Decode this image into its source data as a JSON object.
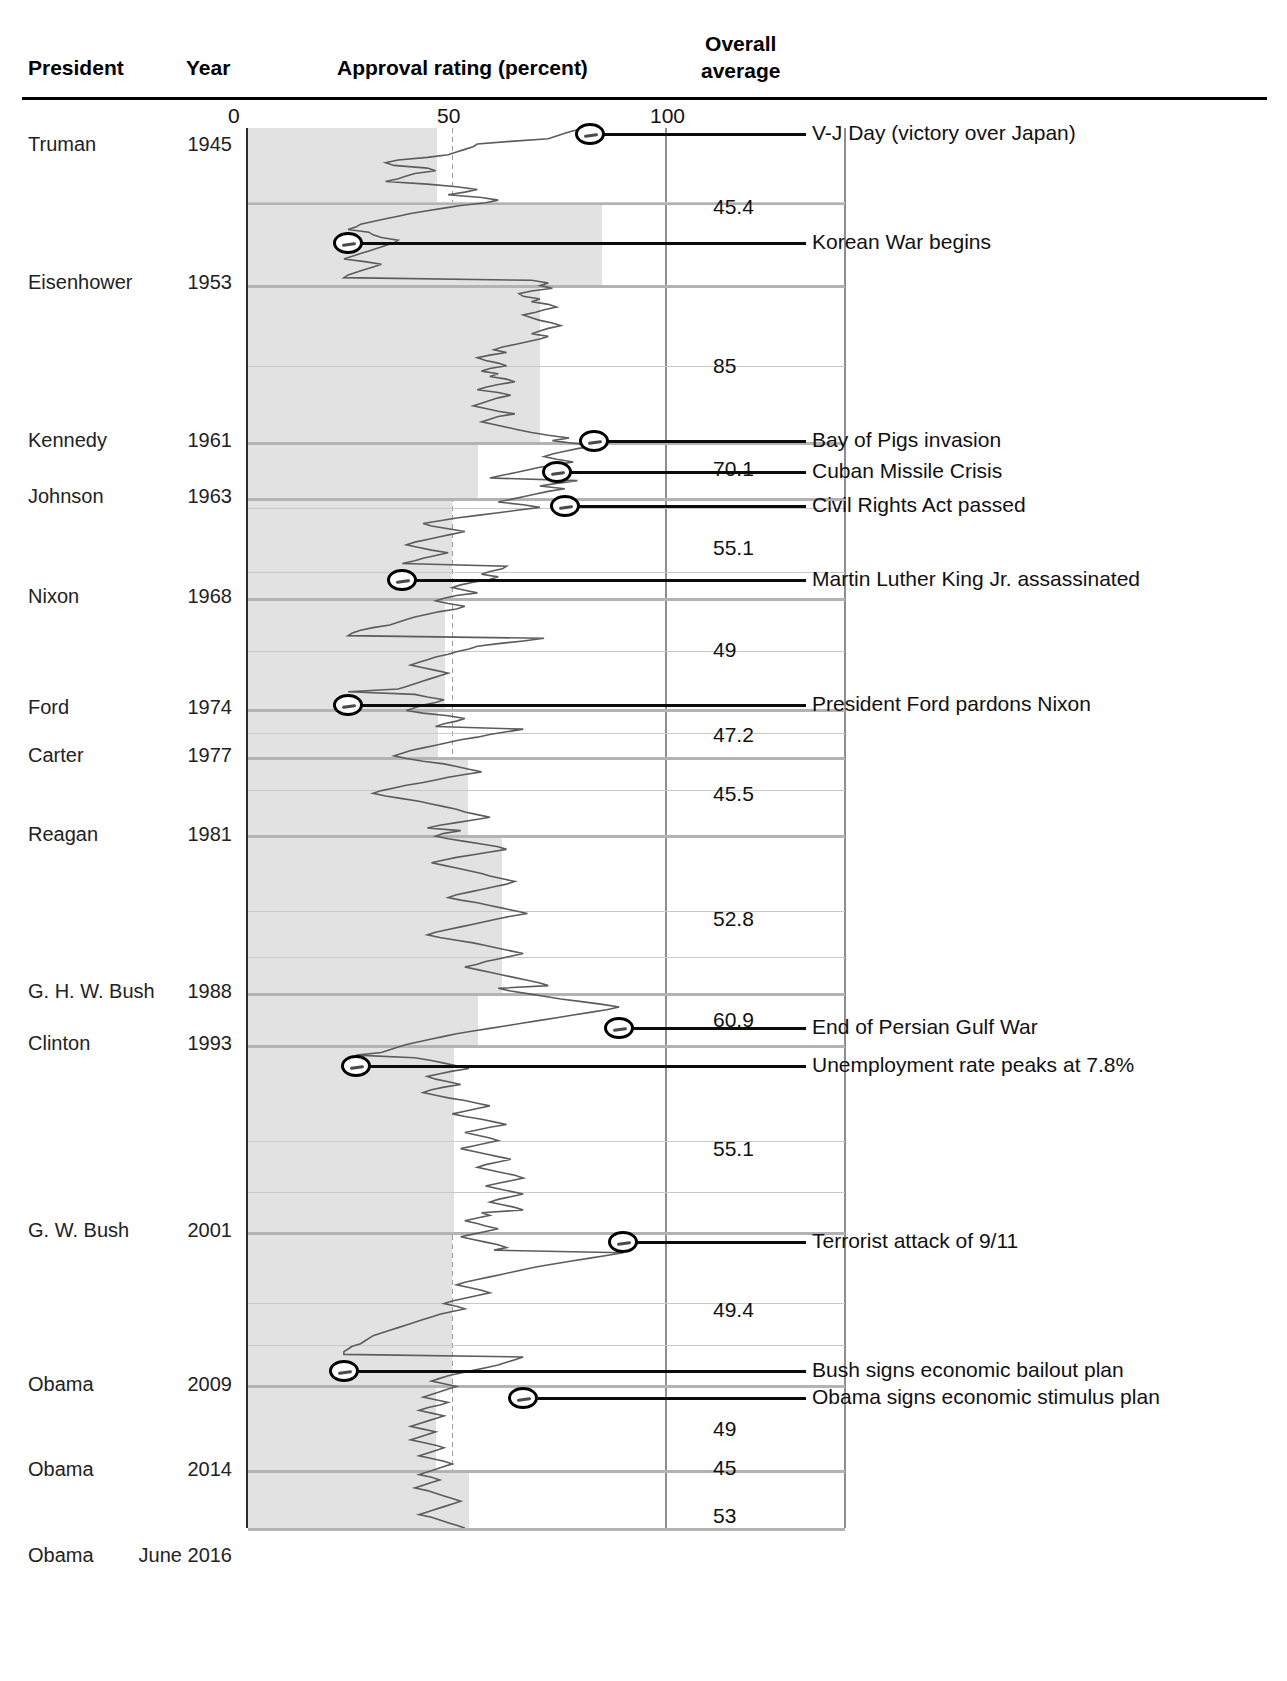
{
  "header": {
    "col_president": "President",
    "col_year": "Year",
    "col_approval": "Approval rating (percent)",
    "col_overall_line1": "Overall",
    "col_overall_line2": "average"
  },
  "axis": {
    "ticks": [
      "0",
      "50",
      "100"
    ],
    "min": 0,
    "max": 100
  },
  "rows": [
    {
      "president": "Truman",
      "year": "1945",
      "average": "45.4"
    },
    {
      "president": "Eisenhower",
      "year": "1953",
      "average": "85"
    },
    {
      "president": "Kennedy",
      "year": "1961",
      "average": "70.1"
    },
    {
      "president": "Johnson",
      "year": "1963",
      "average": "55.1"
    },
    {
      "president": "Nixon",
      "year": "1968",
      "average": "49"
    },
    {
      "president": "Ford",
      "year": "1974",
      "average": "47.2"
    },
    {
      "president": "Carter",
      "year": "1977",
      "average": "45.5"
    },
    {
      "president": "Reagan",
      "year": "1981",
      "average": "52.8"
    },
    {
      "president": "G. H. W. Bush",
      "year": "1988",
      "average": "60.9"
    },
    {
      "president": "Clinton",
      "year": "1993",
      "average": "55.1"
    },
    {
      "president": "G. W. Bush",
      "year": "2001",
      "average": "49.4"
    },
    {
      "president": "Obama",
      "year": "2009",
      "average": "49"
    },
    {
      "president": "Obama",
      "year": "2014",
      "average": "45"
    },
    {
      "president": "Obama",
      "year": "June 2016",
      "average": "53"
    }
  ],
  "annotations": [
    {
      "label": "V-J Day (victory over Japan)",
      "value": 82
    },
    {
      "label": "Korean War begins",
      "value": 24
    },
    {
      "label": "Bay of Pigs invasion",
      "value": 83
    },
    {
      "label": "Cuban Missile Crisis",
      "value": 74
    },
    {
      "label": "Civil Rights Act passed",
      "value": 76
    },
    {
      "label": "Martin Luther King Jr. assassinated",
      "value": 37
    },
    {
      "label": "President Ford pardons Nixon",
      "value": 24
    },
    {
      "label": "End of Persian Gulf War",
      "value": 89
    },
    {
      "label": "Unemployment rate peaks at 7.8%",
      "value": 26
    },
    {
      "label": "Terrorist attack of 9/11",
      "value": 90
    },
    {
      "label": "Bush signs economic bailout plan",
      "value": 23
    },
    {
      "label": "Obama signs economic stimulus plan",
      "value": 66
    }
  ],
  "chart_data": {
    "type": "line",
    "xlabel": "Approval rating (percent)",
    "ylabel": "Year",
    "xlim": [
      0,
      100
    ],
    "grid": true,
    "orientation": "vertical-time",
    "legend": "none",
    "presidents": [
      {
        "name": "Truman",
        "start_year": 1945,
        "overall_average": 45.4
      },
      {
        "name": "Eisenhower",
        "start_year": 1953,
        "overall_average": 85
      },
      {
        "name": "Kennedy",
        "start_year": 1961,
        "overall_average": 70.1
      },
      {
        "name": "Johnson",
        "start_year": 1963,
        "overall_average": 55.1
      },
      {
        "name": "Nixon",
        "start_year": 1968,
        "overall_average": 49
      },
      {
        "name": "Ford",
        "start_year": 1974,
        "overall_average": 47.2
      },
      {
        "name": "Carter",
        "start_year": 1977,
        "overall_average": 45.5
      },
      {
        "name": "Reagan",
        "start_year": 1981,
        "overall_average": 52.8
      },
      {
        "name": "G. H. W. Bush",
        "start_year": 1988,
        "overall_average": 60.9
      },
      {
        "name": "Clinton",
        "start_year": 1993,
        "overall_average": 55.1
      },
      {
        "name": "G. W. Bush",
        "start_year": 2001,
        "overall_average": 49.4
      },
      {
        "name": "Obama",
        "start_year": 2009,
        "overall_average": 49
      },
      {
        "name": "Obama",
        "start_year": 2014,
        "overall_average": 45
      },
      {
        "name": "Obama",
        "start_year": 2016,
        "overall_average": 53
      }
    ],
    "events": [
      {
        "label": "V-J Day (victory over Japan)",
        "approval": 82
      },
      {
        "label": "Korean War begins",
        "approval": 24
      },
      {
        "label": "Bay of Pigs invasion",
        "approval": 83
      },
      {
        "label": "Cuban Missile Crisis",
        "approval": 74
      },
      {
        "label": "Civil Rights Act passed",
        "approval": 76
      },
      {
        "label": "Martin Luther King Jr. assassinated",
        "approval": 37
      },
      {
        "label": "President Ford pardons Nixon",
        "approval": 24
      },
      {
        "label": "End of Persian Gulf War",
        "approval": 89
      },
      {
        "label": "Unemployment rate peaks at 7.8%",
        "approval": 26
      },
      {
        "label": "Terrorist attack of 9/11",
        "approval": 90
      },
      {
        "label": "Bush signs economic bailout plan",
        "approval": 23
      },
      {
        "label": "Obama signs economic stimulus plan",
        "approval": 66
      }
    ],
    "series_values": [
      82,
      78,
      76,
      74,
      72,
      63,
      55,
      54,
      52,
      50,
      48,
      43,
      36,
      33,
      35,
      43,
      45,
      40,
      38,
      36,
      33,
      43,
      50,
      55,
      52,
      48,
      56,
      60,
      57,
      51,
      47,
      43,
      39,
      36,
      33,
      30,
      27,
      26,
      24,
      29,
      30,
      32,
      36,
      35,
      33,
      31,
      29,
      27,
      25,
      23,
      28,
      32,
      30,
      28,
      26,
      24,
      23,
      68,
      72,
      70,
      73,
      68,
      65,
      66,
      70,
      68,
      72,
      74,
      71,
      69,
      66,
      68,
      70,
      73,
      75,
      72,
      70,
      68,
      72,
      70,
      67,
      64,
      61,
      59,
      62,
      58,
      55,
      57,
      60,
      62,
      58,
      56,
      60,
      58,
      62,
      64,
      60,
      57,
      55,
      60,
      63,
      60,
      58,
      56,
      54,
      57,
      60,
      64,
      60,
      58,
      56,
      59,
      62,
      65,
      68,
      72,
      77,
      73,
      78,
      83,
      79,
      76,
      73,
      71,
      74,
      78,
      74,
      70,
      67,
      64,
      61,
      58,
      79,
      74,
      70,
      76,
      72,
      69,
      66,
      63,
      60,
      66,
      70,
      65,
      60,
      55,
      50,
      46,
      42,
      44,
      48,
      52,
      49,
      46,
      43,
      40,
      38,
      41,
      44,
      48,
      45,
      42,
      40,
      37,
      62,
      61,
      58,
      56,
      60,
      58,
      54,
      51,
      49,
      52,
      55,
      50,
      47,
      45,
      48,
      52,
      50,
      46,
      43,
      40,
      38,
      36,
      34,
      30,
      27,
      25,
      24,
      71,
      66,
      60,
      55,
      53,
      50,
      48,
      45,
      43,
      41,
      39,
      42,
      45,
      48,
      46,
      44,
      42,
      40,
      38,
      36,
      24,
      40,
      43,
      47,
      45,
      42,
      40,
      38,
      42,
      48,
      52,
      50,
      47,
      45,
      66,
      62,
      58,
      55,
      51,
      48,
      45,
      42,
      39,
      37,
      35,
      38,
      42,
      47,
      50,
      53,
      56,
      52,
      48,
      45,
      42,
      38,
      35,
      32,
      30,
      33,
      37,
      41,
      44,
      47,
      50,
      52,
      55,
      58,
      54,
      50,
      46,
      43,
      51,
      47,
      45,
      48,
      52,
      56,
      60,
      62,
      58,
      54,
      50,
      47,
      44,
      47,
      50,
      53,
      56,
      58,
      61,
      64,
      62,
      59,
      56,
      53,
      50,
      48,
      51,
      55,
      58,
      61,
      64,
      67,
      63,
      60,
      57,
      54,
      51,
      48,
      45,
      43,
      46,
      50,
      54,
      57,
      60,
      63,
      66,
      63,
      60,
      57,
      55,
      52,
      55,
      58,
      61,
      64,
      67,
      70,
      72,
      60,
      63,
      67,
      71,
      75,
      80,
      85,
      89,
      86,
      82,
      78,
      74,
      70,
      66,
      62,
      58,
      54,
      50,
      47,
      44,
      41,
      38,
      36,
      34,
      32,
      26,
      40,
      44,
      47,
      50,
      53,
      49,
      46,
      43,
      45,
      48,
      51,
      47,
      44,
      42,
      45,
      48,
      52,
      55,
      58,
      55,
      52,
      49,
      52,
      56,
      59,
      62,
      58,
      55,
      52,
      55,
      58,
      60,
      57,
      54,
      51,
      54,
      57,
      60,
      63,
      60,
      57,
      55,
      58,
      61,
      64,
      66,
      63,
      60,
      57,
      60,
      63,
      66,
      63,
      60,
      58,
      61,
      64,
      66,
      56,
      58,
      55,
      52,
      55,
      57,
      60,
      57,
      54,
      51,
      54,
      57,
      60,
      62,
      59,
      90,
      86,
      82,
      78,
      74,
      70,
      67,
      64,
      61,
      58,
      55,
      52,
      50,
      53,
      56,
      58,
      55,
      52,
      49,
      47,
      50,
      52,
      49,
      46,
      44,
      42,
      40,
      38,
      36,
      34,
      32,
      30,
      29,
      28,
      27,
      25,
      24,
      23,
      23,
      66,
      64,
      62,
      60,
      57,
      54,
      51,
      48,
      46,
      44,
      47,
      50,
      48,
      46,
      44,
      42,
      45,
      48,
      46,
      43,
      41,
      44,
      47,
      45,
      43,
      41,
      39,
      42,
      45,
      43,
      41,
      39,
      42,
      45,
      47,
      45,
      43,
      41,
      44,
      47,
      49,
      47,
      45,
      43,
      41,
      44,
      46,
      44,
      42,
      40,
      43,
      45,
      47,
      49,
      51,
      49,
      47,
      45,
      43,
      41,
      44,
      46,
      48,
      50,
      52
    ]
  }
}
